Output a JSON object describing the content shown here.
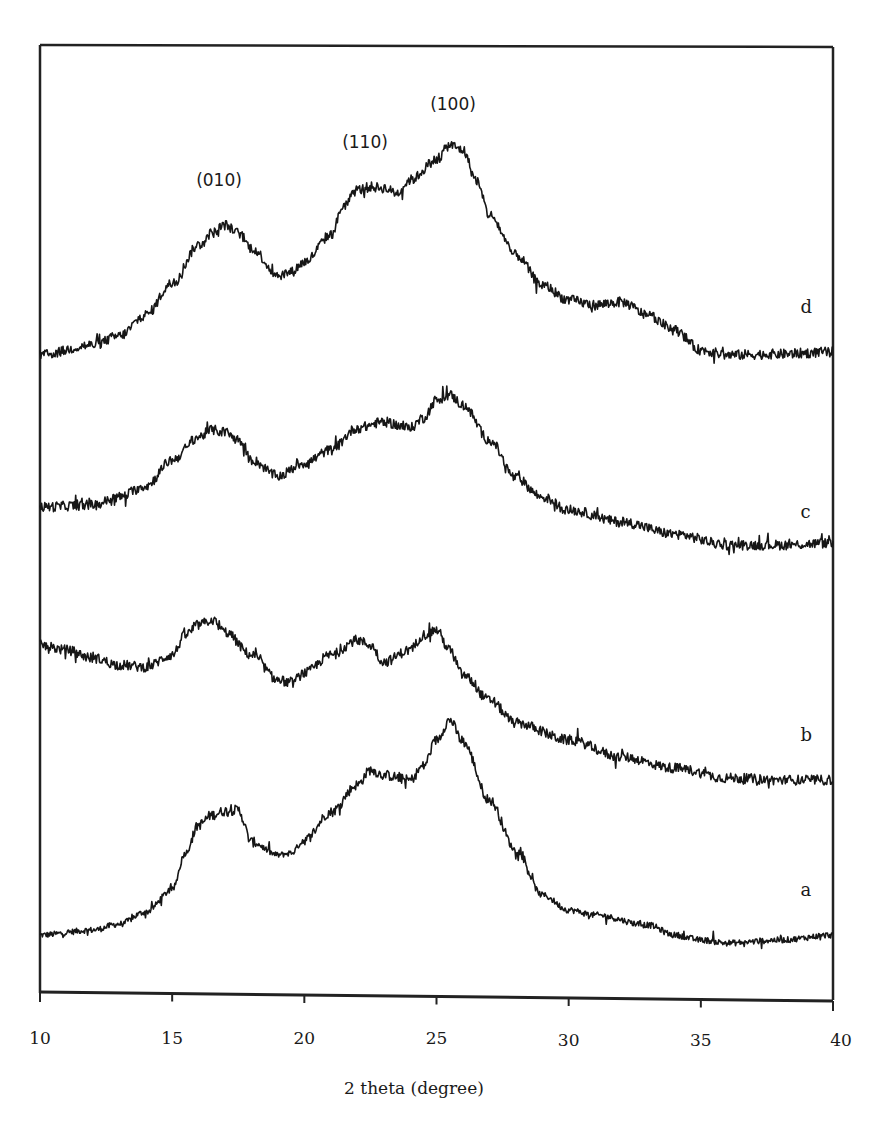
{
  "chart_data": {
    "type": "line",
    "title": "",
    "xlabel": "2 theta (degree)",
    "ylabel": "",
    "xlim": [
      10,
      40
    ],
    "ylim": [
      0,
      950
    ],
    "x_ticks": [
      10,
      15,
      20,
      25,
      30,
      35,
      40
    ],
    "x_tick_labels": [
      "10",
      "15",
      "20",
      "25",
      "30",
      "35",
      "40"
    ],
    "y_ticks": [],
    "grid": false,
    "legend": "none (curves labeled inline at right)",
    "annotations": [
      {
        "text": "(010)",
        "x": 17.0,
        "y": 810
      },
      {
        "text": "(110)",
        "x": 22.6,
        "y": 848
      },
      {
        "text": "(100)",
        "x": 25.6,
        "y": 882
      }
    ],
    "series": [
      {
        "name": "a",
        "label_pos": {
          "x": 39.0,
          "y": 97
        },
        "x": [
          10,
          12,
          13,
          14,
          15,
          15.5,
          16,
          16.5,
          17,
          17.5,
          18,
          19,
          19.5,
          20,
          21,
          22,
          22.5,
          23,
          24,
          24.5,
          25,
          25.5,
          26,
          27,
          28,
          29,
          30,
          31,
          33,
          34,
          35,
          36,
          38,
          40
        ],
        "values": [
          58,
          63,
          69,
          81,
          103,
          140,
          168,
          178,
          182,
          183,
          151,
          138,
          140,
          153,
          181,
          208,
          223,
          218,
          213,
          227,
          253,
          273,
          251,
          193,
          143,
          98,
          83,
          78,
          68,
          58,
          53,
          50,
          53,
          58
        ]
      },
      {
        "name": "b",
        "label_pos": {
          "x": 39.0,
          "y": 252
        },
        "x": [
          10,
          11,
          12,
          13,
          14,
          15,
          15.5,
          16,
          16.5,
          17,
          18,
          19,
          19.5,
          20,
          21,
          22,
          22.5,
          23,
          24,
          24.5,
          25,
          25.5,
          26,
          27,
          28,
          30,
          32,
          34,
          36,
          38,
          40
        ],
        "values": [
          348,
          343,
          335,
          328,
          326,
          338,
          358,
          368,
          373,
          361,
          338,
          313,
          310,
          320,
          338,
          353,
          348,
          331,
          343,
          358,
          363,
          343,
          318,
          293,
          270,
          253,
          236,
          225,
          215,
          213,
          213
        ]
      },
      {
        "name": "c",
        "label_pos": {
          "x": 39.0,
          "y": 475
        },
        "x": [
          10,
          12,
          13,
          14,
          15,
          16,
          16.5,
          17,
          17.5,
          18,
          19,
          20,
          21,
          22,
          23,
          24,
          24.5,
          25,
          25.5,
          26,
          27,
          28,
          29,
          30,
          32,
          34,
          36,
          38,
          40
        ],
        "values": [
          486,
          488,
          496,
          507,
          533,
          556,
          563,
          561,
          553,
          533,
          517,
          530,
          543,
          565,
          571,
          565,
          575,
          593,
          598,
          588,
          553,
          515,
          496,
          483,
          471,
          459,
          448,
          448,
          450
        ]
      },
      {
        "name": "d",
        "label_pos": {
          "x": 39.0,
          "y": 680
        },
        "x": [
          10,
          12,
          13,
          14,
          15,
          16,
          16.5,
          17,
          17.5,
          18,
          19,
          19.5,
          20,
          21,
          21.5,
          22,
          22.5,
          23,
          23.5,
          24,
          25,
          25.5,
          26,
          26.5,
          27,
          28,
          29,
          30,
          31,
          32,
          33,
          34,
          35,
          36,
          38,
          40
        ],
        "values": [
          638,
          648,
          657,
          678,
          710,
          748,
          760,
          768,
          760,
          745,
          718,
          721,
          731,
          758,
          788,
          803,
          806,
          805,
          800,
          813,
          833,
          848,
          843,
          813,
          778,
          738,
          708,
          693,
          688,
          691,
          678,
          663,
          643,
          638,
          639,
          641
        ]
      }
    ]
  }
}
